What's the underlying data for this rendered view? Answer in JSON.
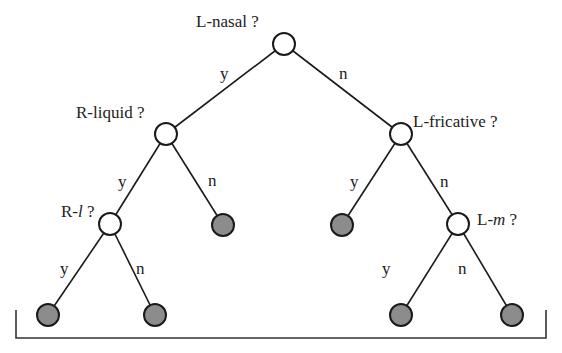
{
  "diagram": {
    "type": "binary decision tree",
    "colors": {
      "internal_node_fill": "#ffffff",
      "leaf_fill": "#8c8c8c",
      "stroke": "#1a1a1a"
    },
    "nodes": {
      "root": {
        "question_prefix": "L-nasal",
        "question_italic": "",
        "question_suffix": " ?"
      },
      "r_liquid": {
        "question_prefix": "R-liquid",
        "question_italic": "",
        "question_suffix": " ?"
      },
      "l_fricative": {
        "question_prefix": "L-fricative",
        "question_italic": "",
        "question_suffix": " ?"
      },
      "r_l": {
        "question_prefix": "R-",
        "question_italic": "l",
        "question_suffix": " ?"
      },
      "l_m": {
        "question_prefix": "L-",
        "question_italic": "m",
        "question_suffix": " ?"
      }
    },
    "edges": {
      "root_yes": "y",
      "root_no": "n",
      "r_liquid_yes": "y",
      "r_liquid_no": "n",
      "l_fricative_yes": "y",
      "l_fricative_no": "n",
      "r_l_yes": "y",
      "r_l_no": "n",
      "l_m_yes": "y",
      "l_m_no": "n"
    }
  }
}
